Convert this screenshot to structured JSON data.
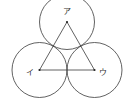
{
  "diagram": {
    "title": "",
    "colors": {
      "stroke": "#3a3a3a",
      "background": "#ffffff"
    },
    "circles": [
      {
        "id": "circle-a",
        "cx": 67,
        "cy": 22,
        "r": 27.5
      },
      {
        "id": "circle-i",
        "cx": 39.5,
        "cy": 70,
        "r": 27.5
      },
      {
        "id": "circle-u",
        "cx": 94.5,
        "cy": 70,
        "r": 27.5
      }
    ],
    "triangle": {
      "points": [
        [
          67,
          22
        ],
        [
          39.5,
          70
        ],
        [
          94.5,
          70
        ]
      ]
    },
    "labels": {
      "a": {
        "text": "ア",
        "x": 67,
        "y": 14
      },
      "i": {
        "text": "イ",
        "x": 30,
        "y": 74
      },
      "u": {
        "text": "ウ",
        "x": 103,
        "y": 74
      }
    }
  }
}
